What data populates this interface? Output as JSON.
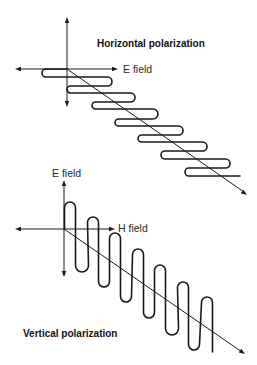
{
  "colors": {
    "line": "#1a1a1a",
    "background": "#ffffff"
  },
  "horizontal": {
    "title": "Horizontal polarization",
    "field_label": "E field",
    "origin": [
      67,
      69
    ],
    "axis_v": {
      "top": 17,
      "bottom": 107
    },
    "axis_h": {
      "left": 15,
      "right": 118
    },
    "propagation_end": [
      247,
      195
    ],
    "wave": {
      "left_turns_x": [
        42,
        67,
        92,
        115,
        138,
        161,
        185
      ],
      "right_turns_x": [
        112,
        135,
        158,
        183,
        207,
        230
      ],
      "top_y": [
        69,
        86,
        102,
        119,
        135,
        151,
        168
      ],
      "bottom_y": [
        77,
        93,
        109,
        126,
        142,
        159,
        176
      ],
      "tail_x": 240
    }
  },
  "vertical": {
    "title": "Vertical polarization",
    "e_label": "E field",
    "h_label": "H field",
    "origin": [
      64,
      229
    ],
    "axis_v": {
      "top": 180,
      "bottom": 277
    },
    "axis_h": {
      "left": 15,
      "right": 115
    },
    "propagation_end": [
      245,
      354
    ],
    "wave": {
      "up_turns_x": [
        70,
        93,
        115,
        138,
        160,
        183,
        207
      ],
      "down_turns_x": [
        82,
        104,
        126,
        149,
        172,
        194
      ],
      "top_y": [
        202,
        217,
        233,
        249,
        265,
        282,
        297
      ],
      "bottom_y": [
        272,
        287,
        302,
        318,
        335,
        350
      ],
      "half_width": 5.5,
      "tail_y": 352
    }
  }
}
